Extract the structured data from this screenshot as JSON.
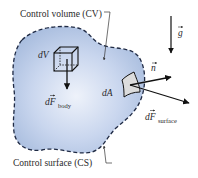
{
  "figure": {
    "type": "control-volume-diagram",
    "colors": {
      "region_fill_center": "#e8eef8",
      "region_fill_edge": "#a9bedf",
      "outline": "#1f2a44",
      "arrow": "#111111",
      "patch_fill": "#d9d9d9",
      "text": "#2a2a2a"
    },
    "labels": {
      "control_volume": "Control volume (CV)",
      "control_surface": "Control surface (CS)",
      "dV": "dV",
      "dF_body_main": "dF",
      "dF_body_sub": "body",
      "dA": "dA",
      "n": "n",
      "g": "g",
      "dF_surface_main": "dF",
      "dF_surface_sub": "surface"
    }
  }
}
